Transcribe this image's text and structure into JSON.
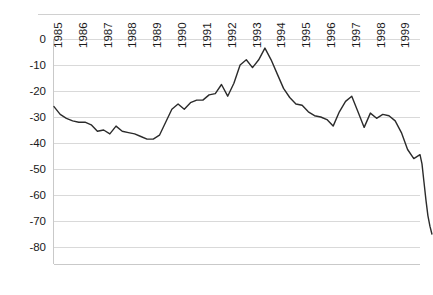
{
  "chart_data": {
    "type": "line",
    "title": "",
    "subtitle": "",
    "xlabel": "",
    "ylabel": "",
    "grid": true,
    "legend": false,
    "legend_position": "none",
    "series_color": "#2b2b2b",
    "ylim": [
      -80,
      0
    ],
    "yticks": [
      0,
      -10,
      -20,
      -30,
      -40,
      -50,
      -60,
      -70,
      -80
    ],
    "ytick_labels": [
      "0",
      "-10",
      "-20",
      "-30",
      "-40",
      "-50",
      "-60",
      "-70",
      "-80"
    ],
    "xlim": [
      1985,
      1999.75
    ],
    "xticks": [
      1985,
      1986,
      1987,
      1988,
      1989,
      1990,
      1991,
      1992,
      1993,
      1994,
      1995,
      1996,
      1997,
      1998,
      1999
    ],
    "xtick_labels": [
      "1985",
      "1986",
      "1987",
      "1988",
      "1989",
      "1990",
      "1991",
      "1992",
      "1993",
      "1994",
      "1995",
      "1996",
      "1997",
      "1998",
      "1999"
    ],
    "xtick_rotation": -90,
    "x": [
      1985.0,
      1985.25,
      1985.5,
      1985.75,
      1986.0,
      1986.25,
      1986.5,
      1986.75,
      1987.0,
      1987.25,
      1987.5,
      1987.75,
      1988.0,
      1988.25,
      1988.5,
      1988.75,
      1989.0,
      1989.25,
      1989.5,
      1989.75,
      1990.0,
      1990.25,
      1990.5,
      1990.75,
      1991.0,
      1991.25,
      1991.5,
      1991.75,
      1992.0,
      1992.25,
      1992.5,
      1992.75,
      1993.0,
      1993.25,
      1993.5,
      1993.75,
      1994.0,
      1994.25,
      1994.5,
      1994.75,
      1995.0,
      1995.25,
      1995.5,
      1995.75,
      1996.0,
      1996.25,
      1996.5,
      1996.75,
      1997.0,
      1997.25,
      1997.5,
      1997.75,
      1998.0,
      1998.25,
      1998.5,
      1998.75,
      1999.0,
      1999.25,
      1999.5,
      1999.75
    ],
    "values": [
      -26.0,
      -29.0,
      -30.5,
      -31.5,
      -32.0,
      -32.0,
      -33.0,
      -35.5,
      -35.0,
      -36.5,
      -33.5,
      -35.5,
      -36.0,
      -36.5,
      -37.5,
      -38.5,
      -38.5,
      -37.0,
      -32.0,
      -27.0,
      -25.0,
      -27.0,
      -24.5,
      -23.5,
      -23.5,
      -21.5,
      -21.0,
      -17.5,
      -22.0,
      -17.0,
      -10.0,
      -8.0,
      -11.0,
      -8.0,
      -3.5,
      -8.0,
      -13.5,
      -19.0,
      -22.5,
      -25.0,
      -25.5,
      -28.0,
      -29.5,
      -30.0,
      -31.0,
      -33.5,
      -28.0,
      -24.0,
      -22.0,
      -28.0,
      -34.0,
      -28.5,
      -30.5,
      -29.0,
      -29.5,
      -31.5,
      -36.0,
      -42.5,
      -46.0,
      -44.5
    ],
    "values_tail": [
      -48.0,
      -55.0,
      -62.0,
      -68.0,
      -72.0,
      -75.0
    ],
    "annotations": []
  },
  "figure": {
    "background": "#ffffff",
    "plot_background": "#ffffff",
    "border_color": "#c9c9c9",
    "gridline_color": "#d9d9d9"
  }
}
